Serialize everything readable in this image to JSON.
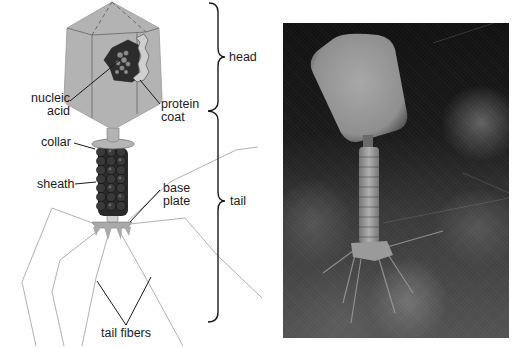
{
  "diagram": {
    "labels": {
      "nucleic_acid_line1": "nucleic",
      "nucleic_acid_line2": "acid",
      "protein_coat_line1": "protein",
      "protein_coat_line2": "coat",
      "collar": "collar",
      "sheath": "sheath",
      "base_plate_line1": "base",
      "base_plate_line2": "plate",
      "tail_fibers": "tail fibers",
      "head": "head",
      "tail": "tail"
    },
    "colors": {
      "head_fill": "#b3b3b3",
      "head_edge": "#8a8a8a",
      "sheath_bead": "#2a2a2a",
      "leader_line": "#1a1a1a",
      "fiber_line": "#a8a8a8",
      "brace": "#1a1a1a"
    }
  },
  "photo": {
    "description": "electron micrograph of bacteriophage",
    "background": "#1a1a1a"
  }
}
